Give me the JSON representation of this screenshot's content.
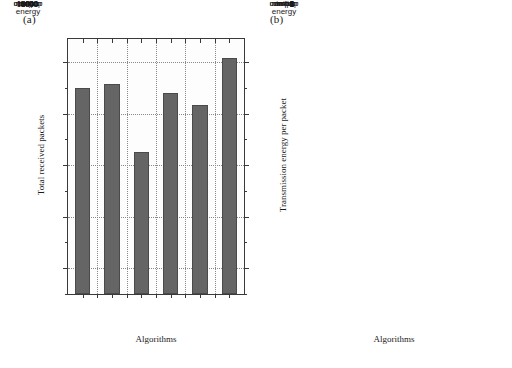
{
  "figure": {
    "panel_a_label": "(a)",
    "panel_b_label": "(b)"
  },
  "chart_data": [
    {
      "type": "bar",
      "panel": "(a)",
      "title": "",
      "categories": [
        "min-hop",
        "min-energy",
        "mmbcr",
        "mrpc",
        "cmmbcr",
        "cmrpc"
      ],
      "category_labels_line1": [
        "min-hop",
        "min-",
        "mmbcr",
        "mrpc",
        "cmmbcr",
        "cmrpc"
      ],
      "category_labels_line2": [
        "",
        "energy",
        "",
        "",
        "",
        ""
      ],
      "values": [
        13000,
        13150,
        10500,
        12800,
        12350,
        14150
      ],
      "xlabel": "Algorithms",
      "ylabel": "Total received packets",
      "ylim": [
        5000,
        14900
      ],
      "yticks": [
        6000,
        8000,
        10000,
        12000,
        14000
      ],
      "ytick_labels": [
        "6000",
        "8000",
        "10000",
        "12000",
        "14000"
      ],
      "yminor_step": 1000,
      "grid": true,
      "legend": "none",
      "bar_color": "#656565"
    },
    {
      "type": "bar",
      "panel": "(b)",
      "title": "",
      "categories": [
        "min-hop",
        "min-energy",
        "mmbcr",
        "mrpc",
        "cmmbcr",
        "cmrpc"
      ],
      "category_labels_line1": [
        "min-hop",
        "min-",
        "mmbcr",
        "mrpc",
        "cmmbcr",
        "cmrpc"
      ],
      "category_labels_line2": [
        "",
        "energy",
        "",
        "",
        "",
        ""
      ],
      "values": [
        4.4,
        3.9,
        6.0,
        5.65,
        4.8,
        4.8
      ],
      "xlabel": "Algorithms",
      "ylabel": "Transmission energy per packet",
      "ylim": [
        0,
        6.55
      ],
      "yticks": [
        0,
        1,
        2,
        3,
        4,
        5,
        6
      ],
      "ytick_labels": [
        "0",
        "1",
        "2",
        "3",
        "4",
        "5",
        "6"
      ],
      "yminor_step": 0.5,
      "grid": true,
      "legend": "none",
      "bar_color": "#656565"
    }
  ]
}
